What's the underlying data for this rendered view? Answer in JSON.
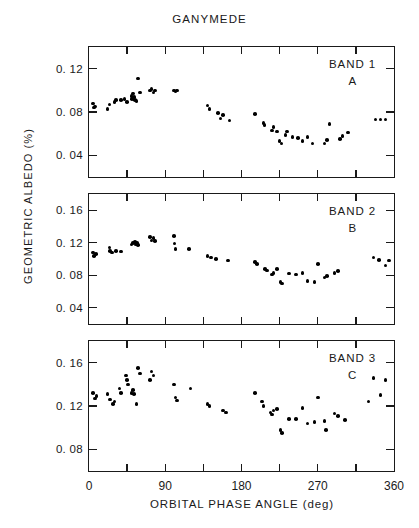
{
  "figure": {
    "title": "GANYMEDE",
    "xlabel": "ORBITAL PHASE ANGLE (deg)",
    "ylabel": "GEOMETRIC ALBEDO (%)"
  },
  "chart_data": [
    {
      "type": "scatter",
      "title": "GANYMEDE",
      "panel_label": "BAND 1",
      "panel_sublabel": "A",
      "xlabel": "ORBITAL PHASE ANGLE (deg)",
      "ylabel": "GEOMETRIC ALBEDO (%)",
      "grid": false,
      "legend": "none",
      "xlim": [
        0,
        360
      ],
      "ylim": [
        0.02,
        0.14
      ],
      "xticks": [
        0,
        45,
        90,
        135,
        180,
        225,
        270,
        315,
        360
      ],
      "xticklabels": [
        "0",
        "",
        "90",
        "",
        "180",
        "",
        "270",
        "",
        "360"
      ],
      "yticks": [
        0.04,
        0.08,
        0.12
      ],
      "yticklabels": [
        "0. 04",
        "0. 08",
        "0. 12"
      ],
      "points": [
        [
          5,
          0.088
        ],
        [
          6,
          0.084
        ],
        [
          7,
          0.085
        ],
        [
          22,
          0.083
        ],
        [
          24,
          0.087
        ],
        [
          30,
          0.089
        ],
        [
          32,
          0.091
        ],
        [
          38,
          0.091
        ],
        [
          42,
          0.092
        ],
        [
          45,
          0.089
        ],
        [
          50,
          0.095
        ],
        [
          51,
          0.092
        ],
        [
          52,
          0.097
        ],
        [
          53,
          0.094
        ],
        [
          54,
          0.091
        ],
        [
          56,
          0.09
        ],
        [
          58,
          0.111
        ],
        [
          60,
          0.098
        ],
        [
          72,
          0.1
        ],
        [
          74,
          0.101
        ],
        [
          76,
          0.098
        ],
        [
          78,
          0.1
        ],
        [
          100,
          0.1
        ],
        [
          102,
          0.099
        ],
        [
          104,
          0.1
        ],
        [
          140,
          0.086
        ],
        [
          142,
          0.083
        ],
        [
          152,
          0.079
        ],
        [
          155,
          0.074
        ],
        [
          158,
          0.077
        ],
        [
          166,
          0.072
        ],
        [
          196,
          0.078
        ],
        [
          206,
          0.07
        ],
        [
          207,
          0.068
        ],
        [
          216,
          0.063
        ],
        [
          218,
          0.066
        ],
        [
          222,
          0.062
        ],
        [
          225,
          0.053
        ],
        [
          227,
          0.051
        ],
        [
          232,
          0.059
        ],
        [
          234,
          0.062
        ],
        [
          240,
          0.057
        ],
        [
          247,
          0.056
        ],
        [
          252,
          0.053
        ],
        [
          258,
          0.057
        ],
        [
          264,
          0.051
        ],
        [
          278,
          0.051
        ],
        [
          281,
          0.054
        ],
        [
          284,
          0.069
        ],
        [
          296,
          0.055
        ],
        [
          299,
          0.058
        ],
        [
          306,
          0.061
        ],
        [
          338,
          0.073
        ],
        [
          344,
          0.073
        ],
        [
          350,
          0.073
        ]
      ]
    },
    {
      "type": "scatter",
      "panel_label": "BAND 2",
      "panel_sublabel": "B",
      "xlabel": "ORBITAL PHASE ANGLE (deg)",
      "ylabel": "GEOMETRIC ALBEDO (%)",
      "grid": false,
      "legend": "none",
      "xlim": [
        0,
        360
      ],
      "ylim": [
        0.02,
        0.18
      ],
      "xticks": [
        0,
        45,
        90,
        135,
        180,
        225,
        270,
        315,
        360
      ],
      "xticklabels": [
        "0",
        "",
        "90",
        "",
        "180",
        "",
        "270",
        "",
        "360"
      ],
      "yticks": [
        0.04,
        0.08,
        0.12,
        0.16
      ],
      "yticklabels": [
        "0. 04",
        "0. 08",
        "0. 12",
        "0. 16"
      ],
      "points": [
        [
          5,
          0.108
        ],
        [
          6,
          0.104
        ],
        [
          8,
          0.106
        ],
        [
          24,
          0.114
        ],
        [
          25,
          0.11
        ],
        [
          27,
          0.108
        ],
        [
          32,
          0.11
        ],
        [
          38,
          0.109
        ],
        [
          50,
          0.118
        ],
        [
          52,
          0.12
        ],
        [
          54,
          0.121
        ],
        [
          55,
          0.118
        ],
        [
          57,
          0.12
        ],
        [
          58,
          0.117
        ],
        [
          72,
          0.127
        ],
        [
          74,
          0.123
        ],
        [
          76,
          0.126
        ],
        [
          78,
          0.122
        ],
        [
          100,
          0.128
        ],
        [
          101,
          0.119
        ],
        [
          102,
          0.112
        ],
        [
          118,
          0.112
        ],
        [
          140,
          0.104
        ],
        [
          144,
          0.102
        ],
        [
          150,
          0.1
        ],
        [
          164,
          0.098
        ],
        [
          196,
          0.096
        ],
        [
          198,
          0.094
        ],
        [
          208,
          0.088
        ],
        [
          210,
          0.086
        ],
        [
          216,
          0.081
        ],
        [
          218,
          0.083
        ],
        [
          222,
          0.088
        ],
        [
          226,
          0.072
        ],
        [
          228,
          0.07
        ],
        [
          236,
          0.082
        ],
        [
          244,
          0.081
        ],
        [
          252,
          0.083
        ],
        [
          258,
          0.073
        ],
        [
          266,
          0.072
        ],
        [
          270,
          0.094
        ],
        [
          278,
          0.077
        ],
        [
          281,
          0.079
        ],
        [
          290,
          0.083
        ],
        [
          294,
          0.085
        ],
        [
          336,
          0.102
        ],
        [
          342,
          0.099
        ],
        [
          350,
          0.092
        ],
        [
          354,
          0.098
        ]
      ]
    },
    {
      "type": "scatter",
      "panel_label": "BAND 3",
      "panel_sublabel": "C",
      "xlabel": "ORBITAL PHASE ANGLE (deg)",
      "ylabel": "GEOMETRIC ALBEDO (%)",
      "grid": false,
      "legend": "none",
      "xlim": [
        0,
        360
      ],
      "ylim": [
        0.06,
        0.18
      ],
      "xticks": [
        0,
        45,
        90,
        135,
        180,
        225,
        270,
        315,
        360
      ],
      "xticklabels": [
        "0",
        "",
        "90",
        "",
        "180",
        "",
        "270",
        "",
        "360"
      ],
      "yticks": [
        0.08,
        0.12,
        0.16
      ],
      "yticklabels": [
        "0. 08",
        "0. 12",
        "0. 16"
      ],
      "points": [
        [
          5,
          0.132
        ],
        [
          7,
          0.127
        ],
        [
          9,
          0.129
        ],
        [
          22,
          0.131
        ],
        [
          25,
          0.126
        ],
        [
          28,
          0.122
        ],
        [
          30,
          0.124
        ],
        [
          36,
          0.136
        ],
        [
          38,
          0.132
        ],
        [
          44,
          0.148
        ],
        [
          45,
          0.144
        ],
        [
          46,
          0.14
        ],
        [
          50,
          0.132
        ],
        [
          52,
          0.135
        ],
        [
          53,
          0.131
        ],
        [
          56,
          0.122
        ],
        [
          58,
          0.155
        ],
        [
          60,
          0.15
        ],
        [
          72,
          0.144
        ],
        [
          74,
          0.152
        ],
        [
          76,
          0.148
        ],
        [
          100,
          0.14
        ],
        [
          102,
          0.128
        ],
        [
          104,
          0.125
        ],
        [
          120,
          0.136
        ],
        [
          140,
          0.122
        ],
        [
          142,
          0.12
        ],
        [
          158,
          0.116
        ],
        [
          162,
          0.114
        ],
        [
          196,
          0.132
        ],
        [
          204,
          0.124
        ],
        [
          206,
          0.12
        ],
        [
          214,
          0.114
        ],
        [
          216,
          0.112
        ],
        [
          218,
          0.116
        ],
        [
          222,
          0.117
        ],
        [
          226,
          0.098
        ],
        [
          228,
          0.095
        ],
        [
          236,
          0.108
        ],
        [
          244,
          0.108
        ],
        [
          252,
          0.118
        ],
        [
          258,
          0.104
        ],
        [
          266,
          0.105
        ],
        [
          270,
          0.128
        ],
        [
          278,
          0.106
        ],
        [
          280,
          0.098
        ],
        [
          290,
          0.113
        ],
        [
          294,
          0.111
        ],
        [
          302,
          0.107
        ],
        [
          330,
          0.124
        ],
        [
          336,
          0.146
        ],
        [
          344,
          0.13
        ],
        [
          350,
          0.144
        ]
      ]
    }
  ]
}
